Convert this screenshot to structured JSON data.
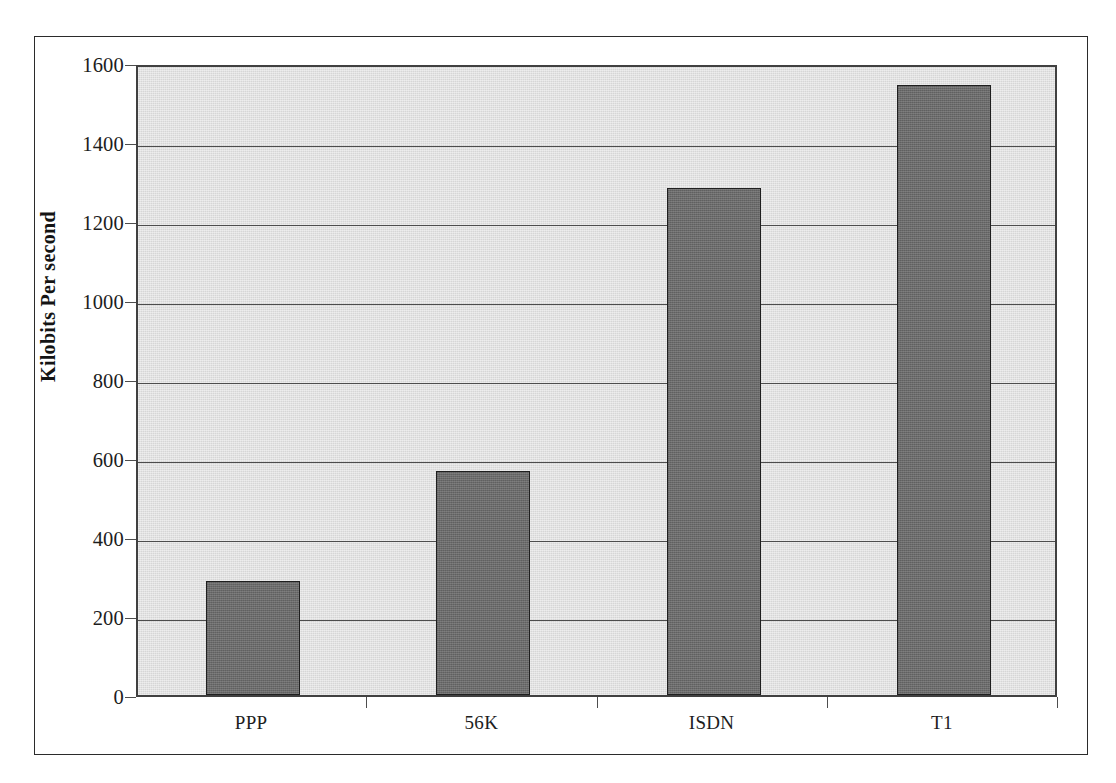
{
  "chart_data": {
    "type": "bar",
    "title": "",
    "xlabel": "",
    "ylabel": "Kilobits Per second",
    "categories": [
      "PPP",
      "56K",
      "ISDN",
      "T1"
    ],
    "values": [
      288,
      566,
      1284,
      1544
    ],
    "ylim": [
      0,
      1600
    ],
    "y_ticks": [
      0,
      200,
      400,
      600,
      800,
      1000,
      1200,
      1400,
      1600
    ],
    "y_tick_labels": [
      "0",
      "200",
      "400",
      "600",
      "800",
      "1000",
      "1200",
      "1400",
      "1600"
    ],
    "grid": true,
    "legend": null,
    "colors": {
      "bar_fill": "#6b6b6b",
      "bar_border": "#1f1f1f",
      "plot_background": "#d6d6d6",
      "gridline": "#4d4d4d",
      "axis": "#404040",
      "frame": "#2b2b2b",
      "text": "#1d1d1d"
    }
  }
}
